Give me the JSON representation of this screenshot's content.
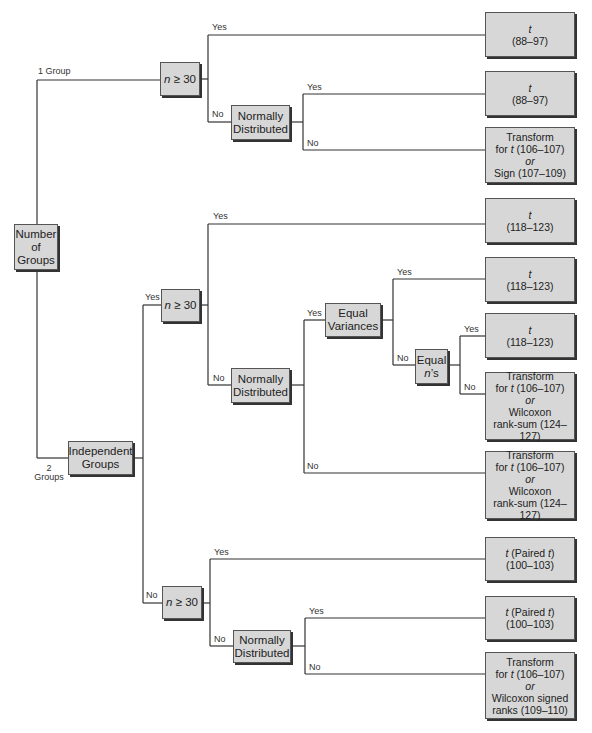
{
  "diagram": {
    "root": {
      "lines": [
        "Number",
        "of",
        "Groups"
      ]
    },
    "branch_labels": {
      "one_group": "1 Group",
      "two_groups_a": "2",
      "two_groups_b": "Groups",
      "yes": "Yes",
      "no": "No"
    },
    "decisions": {
      "n30_symbol": "n",
      "n30_rest": " ≥ 30",
      "normally": [
        "Normally",
        "Distributed"
      ],
      "independent": [
        "Independent",
        "Groups"
      ],
      "equal_var": [
        "Equal",
        "Variances"
      ],
      "equal_n_a": "Equal",
      "equal_n_b_sym": "n",
      "equal_n_b_rest": "’s"
    },
    "leaves": {
      "t": "t",
      "range_88_97": "(88–97)",
      "range_118_123": "(118–123)",
      "range_100_103": "(100–103)",
      "transform": "Transform",
      "for_t_pre": "for ",
      "for_t_rest": " (106–107)",
      "or": "or",
      "sign": "Sign (107–109)",
      "wilcoxon": "Wilcoxon",
      "rank_sum": "rank-sum (124–127)",
      "wilcoxon_signed": "Wilcoxon signed",
      "signed_ranks": "ranks (109–110)",
      "paired_pre": " (Paired ",
      "paired_post": ")"
    }
  }
}
